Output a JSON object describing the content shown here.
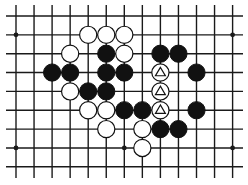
{
  "board": {
    "cols": 13,
    "rows": 9,
    "x0": 16,
    "dx": 18.05,
    "y0": 16,
    "dy": 18.85,
    "line_color": "#1a1a1a",
    "background": "#ffffff",
    "star_points": [
      [
        0,
        1
      ],
      [
        12,
        1
      ],
      [
        0,
        7
      ],
      [
        6,
        7
      ],
      [
        12,
        7
      ]
    ],
    "stones": [
      {
        "c": 4,
        "r": 1,
        "color": "white"
      },
      {
        "c": 5,
        "r": 1,
        "color": "white"
      },
      {
        "c": 6,
        "r": 1,
        "color": "white"
      },
      {
        "c": 3,
        "r": 2,
        "color": "white"
      },
      {
        "c": 5,
        "r": 2,
        "color": "black"
      },
      {
        "c": 6,
        "r": 2,
        "color": "white"
      },
      {
        "c": 8,
        "r": 2,
        "color": "black"
      },
      {
        "c": 9,
        "r": 2,
        "color": "black"
      },
      {
        "c": 2,
        "r": 3,
        "color": "black"
      },
      {
        "c": 3,
        "r": 3,
        "color": "black"
      },
      {
        "c": 5,
        "r": 3,
        "color": "black"
      },
      {
        "c": 6,
        "r": 3,
        "color": "black"
      },
      {
        "c": 8,
        "r": 3,
        "color": "white",
        "mark": "triangle"
      },
      {
        "c": 10,
        "r": 3,
        "color": "black"
      },
      {
        "c": 3,
        "r": 4,
        "color": "white"
      },
      {
        "c": 4,
        "r": 4,
        "color": "black"
      },
      {
        "c": 5,
        "r": 4,
        "color": "black"
      },
      {
        "c": 8,
        "r": 4,
        "color": "white",
        "mark": "triangle"
      },
      {
        "c": 4,
        "r": 5,
        "color": "white"
      },
      {
        "c": 5,
        "r": 5,
        "color": "white"
      },
      {
        "c": 6,
        "r": 5,
        "color": "black"
      },
      {
        "c": 7,
        "r": 5,
        "color": "black"
      },
      {
        "c": 8,
        "r": 5,
        "color": "white",
        "mark": "triangle"
      },
      {
        "c": 10,
        "r": 5,
        "color": "black"
      },
      {
        "c": 5,
        "r": 6,
        "color": "white"
      },
      {
        "c": 7,
        "r": 6,
        "color": "white"
      },
      {
        "c": 8,
        "r": 6,
        "color": "black"
      },
      {
        "c": 9,
        "r": 6,
        "color": "black"
      },
      {
        "c": 7,
        "r": 7,
        "color": "white"
      }
    ]
  }
}
